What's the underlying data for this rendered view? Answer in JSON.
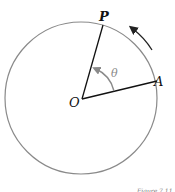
{
  "diagram": {
    "labels": {
      "P": "P",
      "A": "A",
      "O": "O",
      "theta": "θ"
    },
    "caption": "Figure 7.11",
    "colors": {
      "circle": "#8a8a8a",
      "radius": "#111111",
      "angle_arc": "#8a8a8a",
      "theta_label": "#8a8a8a",
      "direction_arrow": "#222222",
      "text": "#111111"
    }
  }
}
